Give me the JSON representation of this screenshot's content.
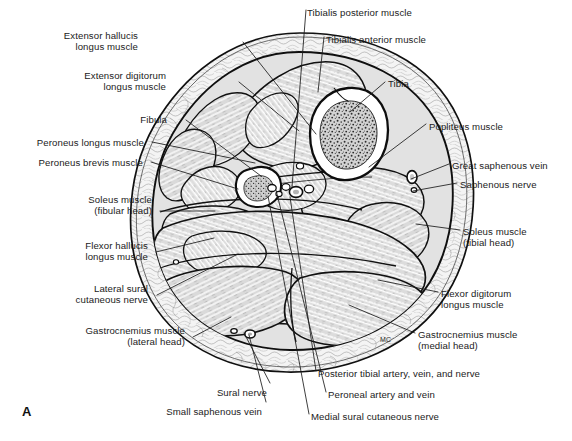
{
  "figure": {
    "panel_letter": "A",
    "artist_mark": "MC",
    "background_color": "#ffffff",
    "ink_color": "#1b1b1b",
    "muscle_fill": "#d9d9d9",
    "fat_fill": "#f2f2f2",
    "bone_cortex_fill": "#ffffff",
    "marrow_fill": "#cfcfcf",
    "vessel_fill": "#ffffff"
  },
  "labels": {
    "left": [
      {
        "id": "extensor-hallucis-longus-muscle",
        "lines": [
          "Extensor hallucis",
          "longus muscle"
        ],
        "x": 138,
        "y": 30,
        "align": "right"
      },
      {
        "id": "extensor-digitorum-longus-muscle",
        "lines": [
          "Extensor digitorum",
          "longus muscle"
        ],
        "x": 166,
        "y": 70,
        "align": "right"
      },
      {
        "id": "fibula",
        "lines": [
          "Fibula"
        ],
        "x": 167,
        "y": 114,
        "align": "right"
      },
      {
        "id": "peroneus-longus-muscle",
        "lines": [
          "Peroneus longus muscle"
        ],
        "x": 144,
        "y": 137,
        "align": "right"
      },
      {
        "id": "peroneus-brevis-muscle",
        "lines": [
          "Peroneus brevis muscle"
        ],
        "x": 143,
        "y": 157,
        "align": "right"
      },
      {
        "id": "soleus-muscle-fibular-head",
        "lines": [
          "Soleus muscle",
          "(fibular head)"
        ],
        "x": 152,
        "y": 194,
        "align": "right"
      },
      {
        "id": "flexor-hallucis-longus-muscle",
        "lines": [
          "Flexor hallucis",
          "longus muscle"
        ],
        "x": 148,
        "y": 240,
        "align": "right"
      },
      {
        "id": "lateral-sural-cutaneous-nerve",
        "lines": [
          "Lateral sural",
          "cutaneous nerve"
        ],
        "x": 148,
        "y": 283,
        "align": "right"
      },
      {
        "id": "gastrocnemius-muscle-lateral-head",
        "lines": [
          "Gastrocnemius muscle",
          "(lateral head)"
        ],
        "x": 185,
        "y": 325,
        "align": "right"
      }
    ],
    "top": [
      {
        "id": "tibialis-posterior-muscle",
        "lines": [
          "Tibialis posterior muscle"
        ],
        "x": 307,
        "y": 7,
        "align": "left"
      },
      {
        "id": "tibialis-anterior-muscle",
        "lines": [
          "Tibialis anterior muscle"
        ],
        "x": 326,
        "y": 34,
        "align": "left"
      }
    ],
    "right": [
      {
        "id": "tibia",
        "lines": [
          "Tibia"
        ],
        "x": 388,
        "y": 78,
        "align": "left"
      },
      {
        "id": "popliteus-muscle",
        "lines": [
          "Popliteus muscle"
        ],
        "x": 429,
        "y": 121,
        "align": "left"
      },
      {
        "id": "great-saphenous-vein",
        "lines": [
          "Great saphenous vein"
        ],
        "x": 452,
        "y": 160,
        "align": "left"
      },
      {
        "id": "saphenous-nerve",
        "lines": [
          "Saphenous nerve"
        ],
        "x": 460,
        "y": 179,
        "align": "left"
      },
      {
        "id": "soleus-muscle-tibial-head",
        "lines": [
          "Soleus muscle",
          "(tibial head)"
        ],
        "x": 463,
        "y": 226,
        "align": "left"
      },
      {
        "id": "flexor-digitorum-longus-muscle",
        "lines": [
          "Flexor digitorum",
          "longus muscle"
        ],
        "x": 441,
        "y": 288,
        "align": "left"
      },
      {
        "id": "gastrocnemius-muscle-medial-head",
        "lines": [
          "Gastrocnemius muscle",
          "(medial head)"
        ],
        "x": 418,
        "y": 329,
        "align": "left"
      }
    ],
    "bottom": [
      {
        "id": "posterior-tibial-artery-vein-and-nerve",
        "lines": [
          "Posterior tibial artery, vein, and nerve"
        ],
        "x": 318,
        "y": 368,
        "align": "left"
      },
      {
        "id": "peroneal-artery-and-vein",
        "lines": [
          "Peroneal artery and vein"
        ],
        "x": 328,
        "y": 389,
        "align": "left"
      },
      {
        "id": "medial-sural-cutaneous-nerve",
        "lines": [
          "Medial sural cutaneous nerve"
        ],
        "x": 311,
        "y": 411,
        "align": "left"
      },
      {
        "id": "sural-nerve",
        "lines": [
          "Sural nerve"
        ],
        "x": 267,
        "y": 387,
        "align": "right"
      },
      {
        "id": "small-saphenous-vein",
        "lines": [
          "Small saphenous vein"
        ],
        "x": 262,
        "y": 406,
        "align": "right"
      }
    ]
  },
  "leaders": [
    {
      "id": "leader-extensor-hallucis-longus",
      "points": "243,42 316,134"
    },
    {
      "id": "leader-extensor-digitorum-longus",
      "points": "239,82 299,131"
    },
    {
      "id": "leader-fibula",
      "points": "186,120 261,176"
    },
    {
      "id": "leader-peroneus-longus",
      "points": "152,142 255,163"
    },
    {
      "id": "leader-peroneus-brevis",
      "points": "151,162 238,189"
    },
    {
      "id": "leader-soleus-fibular-head",
      "points": "160,211 215,211"
    },
    {
      "id": "leader-flexor-hallucis-longus",
      "points": "156,252 214,238"
    },
    {
      "id": "leader-lateral-sural",
      "points": "157,295 238,254"
    },
    {
      "id": "leader-gastrocnemius-lateral-head",
      "points": "193,337 231,317"
    },
    {
      "id": "leader-tibialis-posterior",
      "points": "306,10 292,187"
    },
    {
      "id": "leader-tibialis-anterior",
      "points": "324,37 318,92"
    },
    {
      "id": "leader-tibia",
      "points": "385,82 350,112"
    },
    {
      "id": "leader-popliteus",
      "points": "426,124 369,167"
    },
    {
      "id": "leader-great-saphenous",
      "points": "449,164 411,179"
    },
    {
      "id": "leader-saphenous-nerve",
      "points": "457,183 413,191"
    },
    {
      "id": "leader-soleus-tibial-head",
      "points": "460,230 416,224"
    },
    {
      "id": "leader-flexor-digitorum-longus",
      "points": "438,292 378,280"
    },
    {
      "id": "leader-gastrocnemius-medial-head",
      "points": "415,333 349,305"
    },
    {
      "id": "leader-posterior-tibial",
      "points": "316,371 290,197"
    },
    {
      "id": "leader-peroneal-artery",
      "points": "326,392 276,190"
    },
    {
      "id": "leader-medial-sural",
      "points": "309,414 268,196"
    },
    {
      "id": "leader-sural-nerve",
      "points": "270,383 244,333"
    },
    {
      "id": "leader-small-saphenous",
      "points": "266,402 249,335"
    }
  ],
  "structures": {
    "outer_skin": "outer skin and subcutaneous fat boundary",
    "deep_fascia": "deep fascia of the leg",
    "compartments": [
      "anterior compartment",
      "lateral compartment",
      "deep posterior compartment",
      "superficial posterior compartment"
    ],
    "bones": [
      "tibia",
      "fibula"
    ],
    "neurovascular": [
      "posterior tibial artery, vein, and nerve",
      "peroneal artery and vein",
      "great saphenous vein",
      "saphenous nerve",
      "small saphenous vein",
      "sural nerve",
      "medial sural cutaneous nerve",
      "lateral sural cutaneous nerve"
    ]
  }
}
